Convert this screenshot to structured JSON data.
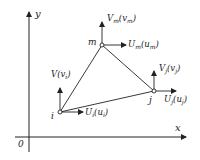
{
  "diagram": {
    "type": "triangular finite element with nodal displacements",
    "colors": {
      "line": "#222222",
      "background": "#ffffff",
      "node_fill": "#ffffff"
    },
    "axes": {
      "x_label": "x",
      "y_label": "y",
      "origin_label": "0"
    },
    "nodes": [
      {
        "id": "i",
        "label": "i",
        "V_main": "V",
        "V_paren": "v",
        "V_sub": "i",
        "U_main": "U",
        "U_sub": "i",
        "U_paren": "u",
        "U_paren_sub": "i"
      },
      {
        "id": "m",
        "label": "m",
        "V_main": "V",
        "V_sub": "m",
        "V_paren": "v",
        "V_paren_sub": "m",
        "U_main": "U",
        "U_sub": "m",
        "U_paren": "u",
        "U_paren_sub": "m"
      },
      {
        "id": "j",
        "label": "j",
        "V_main": "V",
        "V_sub": "j",
        "V_paren": "v",
        "V_paren_sub": "j",
        "U_main": "U",
        "U_sub": "j",
        "U_paren": "u",
        "U_paren_sub": "j"
      }
    ],
    "edges": [
      [
        "i",
        "m"
      ],
      [
        "m",
        "j"
      ],
      [
        "j",
        "i"
      ]
    ]
  }
}
